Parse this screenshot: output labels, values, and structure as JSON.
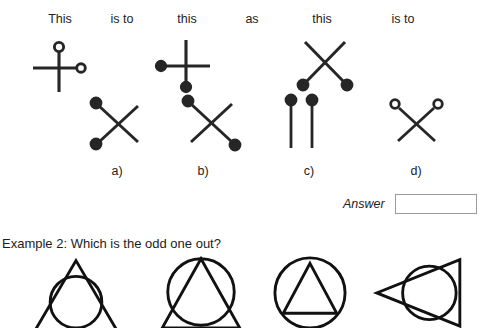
{
  "page": {
    "background_color": "#ffffff",
    "ink_color": "#262626",
    "text_color": "#222222"
  },
  "example1": {
    "header_words": [
      {
        "label": "This",
        "center_x": 60
      },
      {
        "label": "is to",
        "center_x": 122
      },
      {
        "label": "this",
        "center_x": 187
      },
      {
        "label": "as",
        "center_x": 252
      },
      {
        "label": "this",
        "center_x": 322
      },
      {
        "label": "is to",
        "center_x": 403
      }
    ],
    "stimuli": [
      {
        "name": "stimulus-a-cross-open-circles",
        "description": "cross with open circle at top of vertical arm and open circle at end of right arm",
        "left": 26,
        "top": 38,
        "width": 64,
        "height": 56
      },
      {
        "name": "stimulus-b-cross-filled-circles",
        "description": "cross with filled circle at left arm end and filled circle at bottom of vertical arm",
        "left": 152,
        "top": 36,
        "width": 68,
        "height": 60
      },
      {
        "name": "stimulus-c-x-filled-circles-bottom",
        "description": "X shape with filled circles at both bottom ends",
        "left": 292,
        "top": 38,
        "width": 66,
        "height": 54
      }
    ],
    "options": [
      {
        "letter": "a)",
        "name": "option-a",
        "description": "X with filled circles on top-left and bottom-left ends",
        "label_center_x": 117,
        "left": 86,
        "top": 94,
        "width": 64,
        "height": 56
      },
      {
        "letter": "b)",
        "name": "option-b",
        "description": "X with filled circles on top-left and bottom-right ends",
        "label_center_x": 203,
        "left": 180,
        "top": 96,
        "width": 66,
        "height": 54
      },
      {
        "letter": "c)",
        "name": "option-c",
        "description": "two parallel vertical lines each topped with a filled circle",
        "label_center_x": 309,
        "left": 281,
        "top": 94,
        "width": 44,
        "height": 56
      },
      {
        "letter": "d)",
        "name": "option-d",
        "description": "X with open circles at both top ends",
        "label_center_x": 416,
        "left": 387,
        "top": 95,
        "width": 60,
        "height": 50
      }
    ],
    "answer": {
      "label": "Answer",
      "value": "",
      "placeholder": ""
    }
  },
  "example2": {
    "prompt": "Example 2: Which is the odd one out?",
    "figures": [
      {
        "name": "figure-1-triangle-over-circle",
        "description": "upright triangle with a circle inscribed toward its base, circle crossing the sides",
        "left": 24,
        "width": 104
      },
      {
        "name": "figure-2-circle-over-triangle",
        "description": "large circle with an upright triangle inscribed, apex at top of circle",
        "left": 148,
        "width": 106
      },
      {
        "name": "figure-3-triangle-inside-circle",
        "description": "circle containing a smaller upright triangle fully inside",
        "left": 264,
        "width": 92
      },
      {
        "name": "figure-4-left-pointing-triangle-with-circle",
        "description": "left-pointing triangle with a circle overlapping its right portion",
        "left": 368,
        "width": 108
      }
    ]
  }
}
